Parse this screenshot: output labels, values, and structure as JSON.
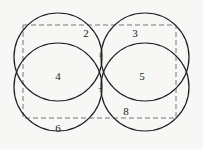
{
  "diagram": {
    "stroke_color": "#1e1e1e",
    "dash_color": "#777777",
    "background": "#f7f7f5",
    "circles": [
      {
        "name": "top-left",
        "cx": 58,
        "cy": 57,
        "r": 44
      },
      {
        "name": "top-right",
        "cx": 145,
        "cy": 57,
        "r": 44
      },
      {
        "name": "bottom-left",
        "cx": 58,
        "cy": 87,
        "r": 44
      },
      {
        "name": "bottom-right",
        "cx": 145,
        "cy": 87,
        "r": 44
      }
    ],
    "rectangle": {
      "x": 23,
      "y": 25,
      "width": 153,
      "height": 93,
      "style": "dashed"
    },
    "labels": {
      "l1": "1",
      "l2": "2",
      "l3": "3",
      "l4": "4",
      "l5": "5",
      "l6": "6",
      "l7": "7",
      "l8": "8"
    }
  }
}
